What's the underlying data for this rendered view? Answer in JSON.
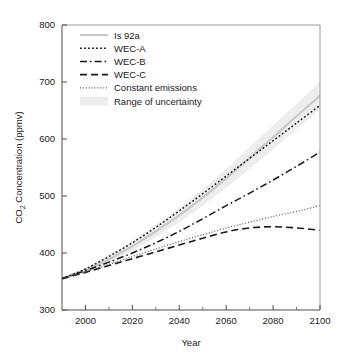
{
  "chart_data": {
    "type": "line",
    "title": "",
    "xlabel": "Year",
    "ylabel": "CO2 Concentration (ppmv)",
    "ylabel_parts": {
      "pre": "CO",
      "sub": "2",
      "post": " Concentration (ppmv)"
    },
    "xlim": [
      1990,
      2100
    ],
    "ylim": [
      300,
      800
    ],
    "xticks": [
      2000,
      2020,
      2040,
      2060,
      2080,
      2100
    ],
    "xticks_minor": [
      2010,
      2030,
      2050,
      2070,
      2090
    ],
    "yticks": [
      300,
      400,
      500,
      600,
      700,
      800
    ],
    "grid": false,
    "legend_position": "top-left",
    "x": [
      1990,
      2000,
      2010,
      2020,
      2030,
      2040,
      2050,
      2060,
      2070,
      2080,
      2090,
      2100
    ],
    "series": [
      {
        "name": "Is 92a",
        "style": "solid",
        "color": "#c8c8c8",
        "width": 2.2,
        "values": [
          355,
          370,
          389,
          412,
          438,
          466,
          497,
          531,
          567,
          603,
          640,
          676
        ]
      },
      {
        "name": "WEC-A",
        "style": "dotted",
        "color": "#1a1a1a",
        "width": 1.5,
        "values": [
          355,
          372,
          394,
          418,
          445,
          474,
          504,
          535,
          566,
          597,
          628,
          659
        ]
      },
      {
        "name": "WEC-B",
        "style": "dashdot",
        "color": "#1a1a1a",
        "width": 1.5,
        "values": [
          355,
          369,
          384,
          400,
          418,
          438,
          460,
          483,
          505,
          528,
          552,
          577
        ]
      },
      {
        "name": "WEC-C",
        "style": "dashed",
        "color": "#1a1a1a",
        "width": 1.6,
        "values": [
          355,
          366,
          378,
          390,
          402,
          414,
          426,
          437,
          444,
          446,
          444,
          440
        ]
      },
      {
        "name": "Constant emissions",
        "style": "finedot",
        "color": "#555555",
        "width": 1.2,
        "values": [
          355,
          367,
          380,
          394,
          407,
          420,
          432,
          444,
          454,
          464,
          473,
          483
        ]
      }
    ],
    "uncertainty_band": {
      "name": "Range of uncertainty",
      "color": "#ededed",
      "upper": [
        358,
        374,
        396,
        421,
        449,
        479,
        512,
        548,
        586,
        624,
        662,
        700
      ],
      "lower": [
        352,
        366,
        383,
        404,
        428,
        454,
        483,
        514,
        548,
        582,
        617,
        652
      ]
    }
  },
  "legend": {
    "items": [
      {
        "label": "Is 92a",
        "swatch": "solid-gray"
      },
      {
        "label": "WEC-A",
        "swatch": "dotted"
      },
      {
        "label": "WEC-B",
        "swatch": "dashdot"
      },
      {
        "label": "WEC-C",
        "swatch": "dashed"
      },
      {
        "label": "Constant emissions",
        "swatch": "finedot"
      },
      {
        "label": "Range of uncertainty",
        "swatch": "band"
      }
    ]
  },
  "axis": {
    "x_title": "Year",
    "y_title_pre": "CO",
    "y_title_sub": "2",
    "y_title_post": " Concentration (ppmv)"
  }
}
